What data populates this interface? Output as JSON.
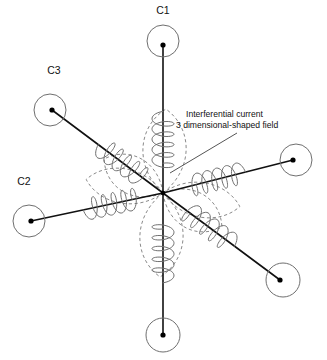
{
  "figure": {
    "background_color": "#ffffff",
    "line_color": "#111111",
    "coil_color": "#6f6f6f",
    "field_color": "#8a8a8a",
    "center": {
      "x": 163,
      "y": 193
    }
  },
  "annotation": {
    "line1": "Interferential current",
    "line2": "3 dimensional-shaped field",
    "leader_from": {
      "x": 237,
      "y": 133
    },
    "leader_to": {
      "x": 170,
      "y": 173
    }
  },
  "electrode_labels": [
    {
      "id": "c1",
      "text": "C1",
      "x": 163,
      "y": 14
    },
    {
      "id": "c3",
      "text": "C3",
      "x": 54,
      "y": 74
    },
    {
      "id": "c2",
      "text": "C2",
      "x": 24,
      "y": 185
    }
  ],
  "electrodes": [
    {
      "id": "c1",
      "label": "C1",
      "angle_deg": 270,
      "cx": 163,
      "cy": 41,
      "r": 16,
      "dot_x": 163,
      "dot_y": 45,
      "coil_start_t": 0.17,
      "coil_end_t": 0.52,
      "coil_turns": 5,
      "coil_amplitude": 11
    },
    {
      "id": "c3",
      "label": "C3",
      "angle_deg": 208,
      "cx": 50,
      "cy": 110,
      "r": 16,
      "dot_x": 52,
      "dot_y": 110,
      "coil_start_t": 0.18,
      "coil_end_t": 0.55,
      "coil_turns": 5,
      "coil_amplitude": 11
    },
    {
      "id": "c2",
      "label": "C2",
      "angle_deg": 192,
      "cx": 29,
      "cy": 221,
      "r": 16,
      "dot_x": 31,
      "dot_y": 221,
      "coil_start_t": 0.2,
      "coil_end_t": 0.57,
      "coil_turns": 5,
      "coil_amplitude": 11
    },
    {
      "id": "c1-opposite",
      "label": "",
      "angle_deg": 90,
      "cx": 163,
      "cy": 335,
      "r": 17,
      "dot_x": 163,
      "dot_y": 335,
      "coil_start_t": 0.22,
      "coil_end_t": 0.6,
      "coil_turns": 5,
      "coil_amplitude": 11
    },
    {
      "id": "c3-opposite",
      "label": "",
      "angle_deg": 28,
      "cx": 283,
      "cy": 280,
      "r": 17,
      "dot_x": 280,
      "dot_y": 280,
      "coil_start_t": 0.2,
      "coil_end_t": 0.58,
      "coil_turns": 5,
      "coil_amplitude": 11
    },
    {
      "id": "c2-opposite",
      "label": "",
      "angle_deg": 12,
      "cx": 296,
      "cy": 160,
      "r": 16,
      "dot_x": 293,
      "dot_y": 160,
      "coil_start_t": 0.22,
      "coil_end_t": 0.6,
      "coil_turns": 5,
      "coil_amplitude": 11
    }
  ],
  "field_lobes": [
    {
      "id": "lobe-up",
      "angle_deg": 272,
      "length": 84,
      "width": 30
    },
    {
      "id": "lobe-down",
      "angle_deg": 92,
      "length": 84,
      "width": 30
    },
    {
      "id": "lobe-upper-left",
      "angle_deg": 210,
      "length": 68,
      "width": 26
    },
    {
      "id": "lobe-lower-right",
      "angle_deg": 30,
      "length": 68,
      "width": 26
    },
    {
      "id": "lobe-left",
      "angle_deg": 190,
      "length": 78,
      "width": 24
    },
    {
      "id": "lobe-right",
      "angle_deg": 10,
      "length": 78,
      "width": 24
    }
  ]
}
